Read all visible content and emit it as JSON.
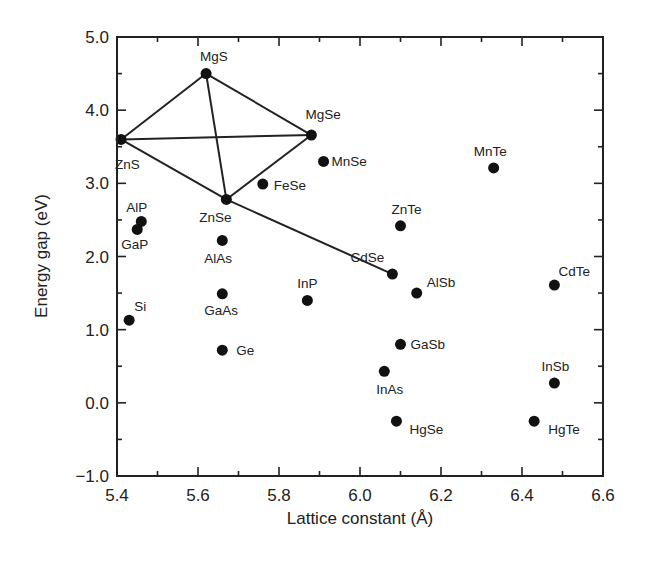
{
  "chart_data": {
    "type": "scatter",
    "title": "",
    "xlabel": "Lattice constant (Å)",
    "ylabel": "Energy gap (eV)",
    "xlim": [
      5.4,
      6.6
    ],
    "ylim": [
      -1.0,
      5.0
    ],
    "x_ticks": [
      5.4,
      5.6,
      5.8,
      6.0,
      6.2,
      6.4,
      6.6
    ],
    "x_tick_labels": [
      "5.4",
      "5.6",
      "5.8",
      "6.0",
      "6.2",
      "6.4",
      "6.6"
    ],
    "x_minor_ticks": [
      5.5,
      5.7,
      5.9,
      6.1,
      6.3,
      6.5
    ],
    "y_ticks": [
      -1.0,
      0.0,
      1.0,
      2.0,
      3.0,
      4.0,
      5.0
    ],
    "y_tick_labels": [
      "−1.0",
      "0.0",
      "1.0",
      "2.0",
      "3.0",
      "4.0",
      "5.0"
    ],
    "y_minor_ticks": [
      -0.5,
      0.5,
      1.5,
      2.5,
      3.5,
      4.5
    ],
    "grid": false,
    "legend": null,
    "points": [
      {
        "name": "ZnS",
        "x": 5.41,
        "y": 3.6,
        "label_dx": -6,
        "label_dy": 30
      },
      {
        "name": "MgS",
        "x": 5.62,
        "y": 4.5,
        "label_dx": -6,
        "label_dy": -13
      },
      {
        "name": "MgSe",
        "x": 5.88,
        "y": 3.66,
        "label_dx": -6,
        "label_dy": -16
      },
      {
        "name": "MnSe",
        "x": 5.91,
        "y": 3.3,
        "label_dx": 8,
        "label_dy": 5
      },
      {
        "name": "FeSe",
        "x": 5.76,
        "y": 2.99,
        "label_dx": 11,
        "label_dy": 6
      },
      {
        "name": "ZnSe",
        "x": 5.67,
        "y": 2.78,
        "label_dx": -27,
        "label_dy": 23
      },
      {
        "name": "AlP",
        "x": 5.46,
        "y": 2.48,
        "label_dx": -15,
        "label_dy": -9
      },
      {
        "name": "GaP",
        "x": 5.45,
        "y": 2.37,
        "label_dx": -16,
        "label_dy": 20
      },
      {
        "name": "AlAs",
        "x": 5.66,
        "y": 2.22,
        "label_dx": -18,
        "label_dy": 23
      },
      {
        "name": "Si",
        "x": 5.43,
        "y": 1.13,
        "label_dx": 5,
        "label_dy": -9
      },
      {
        "name": "GaAs",
        "x": 5.66,
        "y": 1.49,
        "label_dx": -18,
        "label_dy": 21
      },
      {
        "name": "Ge",
        "x": 5.66,
        "y": 0.72,
        "label_dx": 14,
        "label_dy": 5
      },
      {
        "name": "InP",
        "x": 5.87,
        "y": 1.4,
        "label_dx": -10,
        "label_dy": -12
      },
      {
        "name": "CdSe",
        "x": 6.08,
        "y": 1.76,
        "label_dx": -42,
        "label_dy": -12
      },
      {
        "name": "ZnTe",
        "x": 6.1,
        "y": 2.42,
        "label_dx": -9,
        "label_dy": -12
      },
      {
        "name": "AlSb",
        "x": 6.14,
        "y": 1.5,
        "label_dx": 10,
        "label_dy": -6
      },
      {
        "name": "GaSb",
        "x": 6.1,
        "y": 0.8,
        "label_dx": 10,
        "label_dy": 5
      },
      {
        "name": "InAs",
        "x": 6.06,
        "y": 0.43,
        "label_dx": -8,
        "label_dy": 23
      },
      {
        "name": "HgSe",
        "x": 6.09,
        "y": -0.25,
        "label_dx": 13,
        "label_dy": 13
      },
      {
        "name": "MnTe",
        "x": 6.33,
        "y": 3.21,
        "label_dx": -20,
        "label_dy": -12
      },
      {
        "name": "CdTe",
        "x": 6.48,
        "y": 1.61,
        "label_dx": 4,
        "label_dy": -9
      },
      {
        "name": "InSb",
        "x": 6.48,
        "y": 0.27,
        "label_dx": -13,
        "label_dy": -12
      },
      {
        "name": "HgTe",
        "x": 6.43,
        "y": -0.25,
        "label_dx": 14,
        "label_dy": 13
      }
    ],
    "lines": [
      [
        "ZnS",
        "MgS"
      ],
      [
        "MgS",
        "MgSe"
      ],
      [
        "ZnS",
        "MgSe"
      ],
      [
        "MgS",
        "ZnSe"
      ],
      [
        "ZnSe",
        "MgSe"
      ],
      [
        "ZnS",
        "ZnSe"
      ],
      [
        "ZnSe",
        "CdSe"
      ]
    ]
  },
  "style": {
    "marker_color": "#111111",
    "line_color": "#222222",
    "axis_color": "#222222",
    "background": "#ffffff"
  }
}
